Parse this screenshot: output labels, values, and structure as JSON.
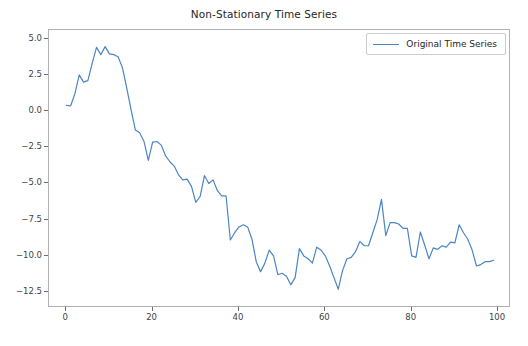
{
  "chart_data": {
    "type": "line",
    "title": "Non-Stationary Time Series",
    "xlabel": "",
    "ylabel": "",
    "xlim": [
      -4.0,
      103.0
    ],
    "ylim": [
      -13.6,
      5.6
    ],
    "grid": false,
    "legend_position": "upper right",
    "xticks": [
      0,
      20,
      40,
      60,
      80,
      100
    ],
    "xtick_labels": [
      "0",
      "20",
      "40",
      "60",
      "80",
      "100"
    ],
    "yticks": [
      5.0,
      2.5,
      0.0,
      -2.5,
      -5.0,
      -7.5,
      -10.0,
      -12.5
    ],
    "ytick_labels": [
      "5.0",
      "2.5",
      "0.0",
      "−2.5",
      "−5.0",
      "−7.5",
      "−10.0",
      "−12.5"
    ],
    "line_color": "#4a86c5",
    "line_width": 1.2,
    "series": [
      {
        "name": "Original Time Series",
        "x": [
          0,
          1,
          2,
          3,
          4,
          5,
          6,
          7,
          8,
          9,
          10,
          11,
          12,
          13,
          14,
          15,
          16,
          17,
          18,
          19,
          20,
          21,
          22,
          23,
          24,
          25,
          26,
          27,
          28,
          29,
          30,
          31,
          32,
          33,
          34,
          35,
          36,
          37,
          38,
          39,
          40,
          41,
          42,
          43,
          44,
          45,
          46,
          47,
          48,
          49,
          50,
          51,
          52,
          53,
          54,
          55,
          56,
          57,
          58,
          59,
          60,
          61,
          62,
          63,
          64,
          65,
          66,
          67,
          68,
          69,
          70,
          71,
          72,
          73,
          74,
          75,
          76,
          77,
          78,
          79,
          80,
          81,
          82,
          83,
          84,
          85,
          86,
          87,
          88,
          89,
          90,
          91,
          92,
          93,
          94,
          95,
          96,
          97,
          98,
          99
        ],
        "values": [
          0.4,
          0.35,
          1.2,
          2.5,
          2.0,
          2.1,
          3.3,
          4.4,
          3.9,
          4.45,
          3.95,
          3.9,
          3.75,
          3.0,
          1.6,
          0.1,
          -1.3,
          -1.5,
          -2.1,
          -3.4,
          -2.15,
          -2.1,
          -2.35,
          -3.1,
          -3.5,
          -3.8,
          -4.4,
          -4.75,
          -4.7,
          -5.2,
          -6.3,
          -5.9,
          -4.45,
          -5.0,
          -4.75,
          -5.5,
          -5.85,
          -5.85,
          -8.9,
          -8.4,
          -8.0,
          -7.85,
          -8.0,
          -8.85,
          -10.4,
          -11.1,
          -10.5,
          -9.6,
          -10.0,
          -11.3,
          -11.2,
          -11.4,
          -12.0,
          -11.5,
          -9.5,
          -10.0,
          -10.2,
          -10.5,
          -9.4,
          -9.6,
          -10.0,
          -10.7,
          -11.5,
          -12.3,
          -11.0,
          -10.2,
          -10.1,
          -9.7,
          -9.0,
          -9.3,
          -9.3,
          -8.4,
          -7.5,
          -6.1,
          -8.6,
          -7.7,
          -7.7,
          -7.8,
          -8.1,
          -8.1,
          -10.0,
          -10.1,
          -8.35,
          -9.25,
          -10.2,
          -9.45,
          -9.55,
          -9.3,
          -9.4,
          -9.05,
          -9.1,
          -7.85,
          -8.4,
          -8.85,
          -9.6,
          -10.7,
          -10.6,
          -10.4,
          -10.4,
          -10.3
        ]
      }
    ]
  },
  "legend": {
    "label": "Original Time Series"
  }
}
